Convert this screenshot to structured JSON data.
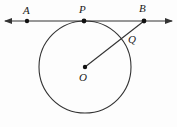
{
  "figure": {
    "background_color": "#fdfdfd",
    "stroke_color": "#333333",
    "point_color": "#111111",
    "width": 177,
    "height": 127,
    "labels": {
      "A": "A",
      "P": "P",
      "B": "B",
      "Q": "Q",
      "O": "O"
    },
    "points": [
      {
        "name": "A",
        "x": 27,
        "y": 21,
        "label": "A",
        "label_x": 27,
        "label_y": 10
      },
      {
        "name": "P",
        "x": 84,
        "y": 21,
        "label": "P",
        "label_x": 83,
        "label_y": 9
      },
      {
        "name": "B",
        "x": 144,
        "y": 21,
        "label": "B",
        "label_x": 143,
        "label_y": 8
      },
      {
        "name": "Q",
        "x": 126,
        "y": 37,
        "label": "Q",
        "label_x": 132,
        "label_y": 39
      },
      {
        "name": "O",
        "x": 85,
        "y": 67,
        "label": "O",
        "label_x": 83,
        "label_y": 77
      }
    ],
    "circle": {
      "center_x": 85,
      "center_y": 67,
      "radius": 46
    },
    "line": {
      "name": "tangent-line-AB",
      "x1": 5,
      "y1": 21,
      "x2": 172,
      "y2": 21,
      "arrow_start": true,
      "arrow_end": true
    },
    "segment": {
      "name": "segment-OB",
      "x1": 85,
      "y1": 67,
      "x2": 144,
      "y2": 21
    }
  }
}
